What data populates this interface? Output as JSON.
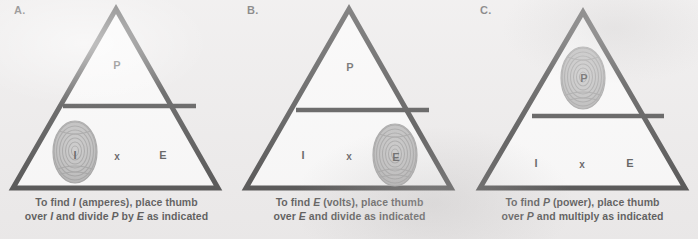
{
  "figure": {
    "background_color": "#eceaea",
    "triangle_stroke_color": "#000000",
    "triangle_fill_color": "#ffffff",
    "text_color": "#111111",
    "thumbprint_color": "#9a9a9a"
  },
  "panels": [
    {
      "label": "A.",
      "name": "panel-a",
      "triangle": {
        "top_cell": "P",
        "bottom_left_cell": "I",
        "bottom_middle_cell": "x",
        "bottom_right_cell": "E",
        "divider": "horizontal-fraction-bar"
      },
      "thumbprint": {
        "covers": "I",
        "position": "bottom-left",
        "cx": 75,
        "cy": 152
      },
      "caption": {
        "line1_pre": "To find ",
        "line1_em": "I",
        "line1_post": " (amperes), place thumb",
        "line2_pre": "over ",
        "line2_em1": "I",
        "line2_mid1": " and divide ",
        "line2_em2": "P",
        "line2_mid2": " by ",
        "line2_em3": "E",
        "line2_post": " as indicated",
        "full": "To find I (amperes), place thumb over I and divide P by E as indicated"
      }
    },
    {
      "label": "B.",
      "name": "panel-b",
      "triangle": {
        "top_cell": "P",
        "bottom_left_cell": "I",
        "bottom_middle_cell": "x",
        "bottom_right_cell": "E",
        "divider": "horizontal-fraction-bar"
      },
      "thumbprint": {
        "covers": "E",
        "position": "bottom-right",
        "cx": 162,
        "cy": 155
      },
      "caption": {
        "line1_pre": "To find ",
        "line1_em": "E",
        "line1_post": " (volts), place thumb",
        "line2_pre": "over ",
        "line2_em1": "E",
        "line2_mid1": " and divide as indicated",
        "line2_em2": "",
        "line2_mid2": "",
        "line2_em3": "",
        "line2_post": "",
        "full": "To find E (volts), place thumb over E and divide as indicated"
      }
    },
    {
      "label": "C.",
      "name": "panel-c",
      "triangle": {
        "top_cell": "P",
        "bottom_left_cell": "I",
        "bottom_middle_cell": "x",
        "bottom_right_cell": "E",
        "divider": "horizontal-fraction-bar"
      },
      "thumbprint": {
        "covers": "P",
        "position": "top-center",
        "cx": 117,
        "cy": 78
      },
      "caption": {
        "line1_pre": "To find ",
        "line1_em": "P",
        "line1_post": " (power), place thumb",
        "line2_pre": "over ",
        "line2_em1": "P",
        "line2_mid1": " and multiply as indicated",
        "line2_em2": "",
        "line2_mid2": "",
        "line2_em3": "",
        "line2_post": "",
        "full": "To find P (power), place thumb over P and multiply as indicated"
      }
    }
  ]
}
